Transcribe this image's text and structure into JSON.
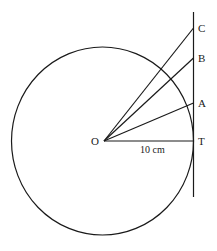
{
  "diagram": {
    "center_label": "O",
    "points": [
      {
        "id": "C",
        "label": "C"
      },
      {
        "id": "B",
        "label": "B"
      },
      {
        "id": "A",
        "label": "A"
      },
      {
        "id": "T",
        "label": "T"
      }
    ],
    "radius_label": "10 cm",
    "stroke_color": "#1a1a1a"
  }
}
